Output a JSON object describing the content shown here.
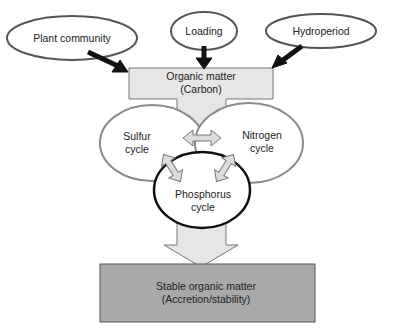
{
  "inputs": [
    {
      "id": "plant",
      "label": "Plant community"
    },
    {
      "id": "loading",
      "label": "Loading"
    },
    {
      "id": "hydro",
      "label": "Hydroperiod"
    }
  ],
  "organic_matter": {
    "line1": "Organic matter",
    "line2": "(Carbon)"
  },
  "cycles": {
    "sulfur": {
      "line1": "Sulfur",
      "line2": "cycle"
    },
    "nitrogen": {
      "line1": "Nitrogen",
      "line2": "cycle"
    },
    "phosphorus": {
      "line1": "Phosphorus",
      "line2": "cycle"
    }
  },
  "output": {
    "line1": "Stable organic matter",
    "line2": "(Accretion/stability)"
  },
  "colors": {
    "box_fill": "#e6e6e6",
    "bottom_fill": "#a9a9a9",
    "ellipse_stroke": "#8a8a8a",
    "dark": "#111111"
  }
}
